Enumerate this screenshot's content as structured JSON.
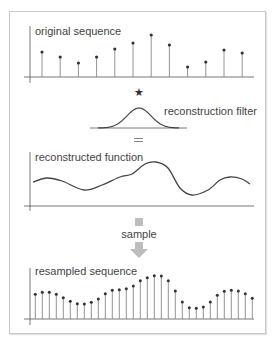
{
  "panels": {
    "original": {
      "label": "original sequence"
    },
    "filter": {
      "label": "reconstruction filter",
      "operator": "★",
      "equals": "="
    },
    "reconstructed": {
      "label": "reconstructed function"
    },
    "sample_step": {
      "label": "sample"
    },
    "resampled": {
      "label": "resampled sequence"
    }
  },
  "colors": {
    "stem": "#888888",
    "dot": "#333333",
    "curve": "#444444",
    "axis": "#555555",
    "arrow": "#bdbdbd",
    "border": "#c8c8c8"
  },
  "chart_data": [
    {
      "type": "stem",
      "title": "original sequence",
      "x_start": 42,
      "x_step": 18.2,
      "baseline_y": 77,
      "values": [
        25,
        20,
        14,
        20,
        28,
        34,
        42,
        32,
        10,
        15,
        27,
        24
      ]
    },
    {
      "type": "line",
      "title": "reconstruction filter",
      "shape": "gaussian",
      "center_x": 139,
      "baseline_y": 128,
      "peak_height": 20,
      "sigma": 12,
      "x_range": [
        90,
        187
      ]
    },
    {
      "type": "line",
      "title": "reconstructed function",
      "baseline_y": 206,
      "points": [
        [
          33,
          182
        ],
        [
          47,
          178
        ],
        [
          62,
          181
        ],
        [
          84,
          190
        ],
        [
          102,
          185
        ],
        [
          120,
          177
        ],
        [
          132,
          174
        ],
        [
          145,
          164
        ],
        [
          156,
          162
        ],
        [
          168,
          168
        ],
        [
          180,
          188
        ],
        [
          192,
          195
        ],
        [
          208,
          190
        ],
        [
          220,
          180
        ],
        [
          230,
          177
        ],
        [
          242,
          179
        ],
        [
          250,
          184
        ]
      ]
    },
    {
      "type": "stem",
      "title": "resampled sequence",
      "x_start": 35.3,
      "x_step": 7.0,
      "baseline_y": 319,
      "values": [
        24.7,
        26.7,
        26.7,
        24.7,
        21.3,
        17.7,
        15.3,
        15.0,
        16.7,
        20.0,
        25.3,
        28.7,
        29.3,
        30.3,
        33.0,
        38.3,
        41.3,
        43.3,
        43.0,
        38.3,
        28.0,
        17.0,
        11.3,
        10.7,
        12.0,
        17.0,
        23.7,
        27.7,
        28.7,
        28.0,
        25.3,
        20.7
      ]
    }
  ]
}
